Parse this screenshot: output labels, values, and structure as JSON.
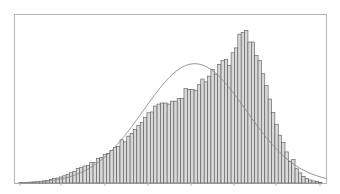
{
  "chart_data": {
    "type": "bar",
    "title": "",
    "xlabel": "",
    "ylabel": "",
    "grid": false,
    "legend": null,
    "bin_count": 70,
    "values": [
      0.2,
      0.3,
      0.4,
      0.5,
      0.6,
      0.8,
      1.0,
      1.3,
      1.6,
      2.0,
      2.6,
      3.0,
      3.6,
      4.3,
      5.2,
      6.1,
      6.9,
      8.6,
      9.1,
      10.1,
      10.4,
      12.1,
      12.1,
      14.7,
      15.3,
      17.0,
      17.6,
      19.4,
      21.1,
      21.7,
      25.7,
      24.5,
      27.9,
      29.6,
      32.0,
      34.2,
      36.0,
      38.9,
      41.8,
      42.3,
      45.8,
      47.0,
      47.6,
      47.6,
      47.0,
      48.7,
      48.7,
      50.4,
      50.4,
      56.2,
      55.6,
      55.6,
      55.0,
      58.5,
      61.9,
      60.2,
      63.6,
      67.7,
      64.8,
      70.6,
      72.9,
      73.5,
      70.0,
      77.5,
      80.4,
      88.6,
      89.7,
      90.9,
      83.9,
      83.9
    ],
    "values_tail": [
      75.8,
      73.0,
      65.0,
      58.0,
      50.0,
      42.0,
      35.0,
      28.5,
      24.0,
      18.5,
      13.0,
      14.0,
      8.5,
      6.0,
      4.0,
      2.8,
      1.8,
      1.2,
      0.8,
      0.4
    ],
    "ylim": [
      0,
      100
    ],
    "curve": {
      "type": "normal_density",
      "peak_x_fraction": 0.58,
      "peak_value": 71,
      "sigma_fraction": 0.17
    },
    "colors": {
      "bar_fill": "#d9d9d9",
      "bar_stroke": "#555555",
      "curve": "#8c8c8c",
      "frame": "#b5b5b5",
      "background": "#ffffff"
    },
    "x_ticks_px": [
      20,
      61,
      105,
      148,
      191,
      234,
      276,
      320
    ]
  }
}
